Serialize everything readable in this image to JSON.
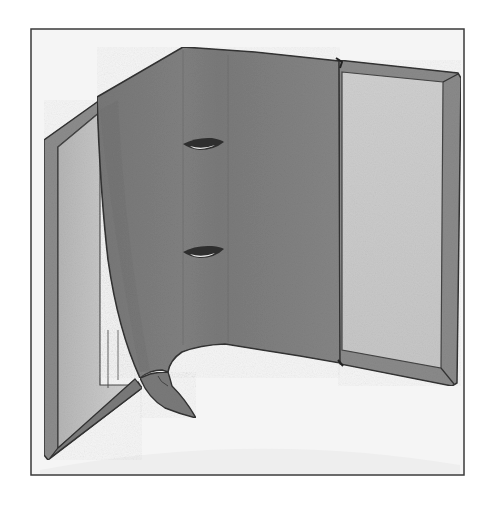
{
  "illustration": {
    "subject": "whale-shaped ring binder folder, opened",
    "style": "grayscale watercolor",
    "colors": {
      "background": "#ffffff",
      "frame_border": "#3a3a3a",
      "inner_bg": "#f4f4f4",
      "whale_body": "#7d7d7d",
      "whale_shadow": "#6e6e6e",
      "panel_inside": "#c4c4c4",
      "panel_edge": "#8a8a8a",
      "outline": "#333333",
      "eye_white": "#e8e8e8",
      "eye_dark": "#2a2a2a"
    }
  }
}
